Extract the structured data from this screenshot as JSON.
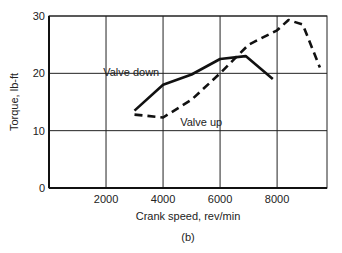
{
  "chart_data": {
    "type": "line",
    "title": "",
    "caption": "(b)",
    "xlabel": "Crank speed, rev/min",
    "ylabel": "Torque, lb-ft",
    "xlim": [
      0,
      9750
    ],
    "ylim": [
      0,
      30
    ],
    "xticks": [
      2000,
      4000,
      6000,
      8000
    ],
    "yticks": [
      0,
      10,
      20,
      30
    ],
    "grid": true,
    "legend": "inline annotations",
    "series": [
      {
        "name": "Valve down",
        "style": "solid",
        "x": [
          3000,
          4000,
          5000,
          6000,
          6900,
          7850
        ],
        "y": [
          13.5,
          18,
          19.8,
          22.5,
          23,
          19
        ]
      },
      {
        "name": "Valve up",
        "style": "dashed",
        "x": [
          3000,
          4000,
          5000,
          6000,
          7000,
          8000,
          8400,
          8900,
          9500
        ],
        "y": [
          12.8,
          12.3,
          15.4,
          20,
          25,
          27.5,
          29.3,
          28.5,
          21
        ]
      }
    ],
    "annotations": [
      {
        "text": "Valve down",
        "x": 1900,
        "y": 19.5
      },
      {
        "text": "Valve up",
        "x": 4600,
        "y": 10.8
      }
    ]
  }
}
